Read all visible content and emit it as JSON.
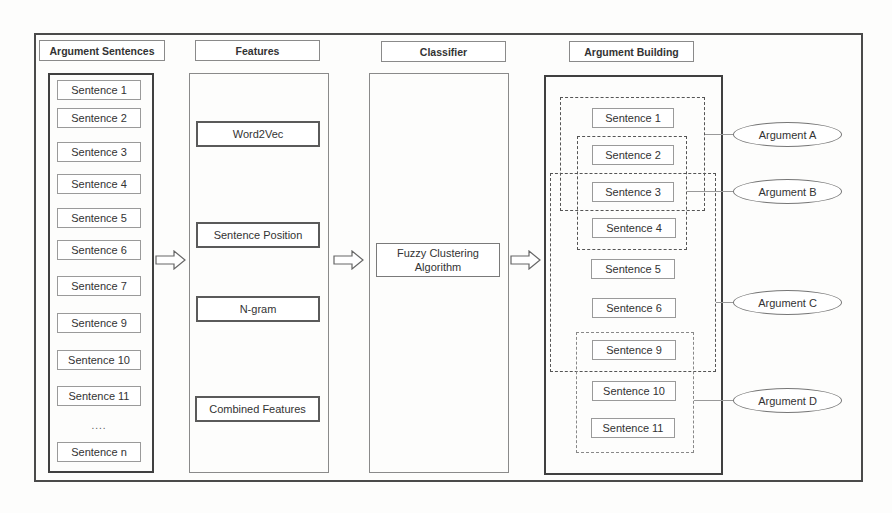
{
  "headers": {
    "argument_sentences": "Argument Sentences",
    "features": "Features",
    "classifier": "Classifier",
    "argument_building": "Argument Building"
  },
  "input_sentences": [
    "Sentence 1",
    "Sentence 2",
    "Sentence 3",
    "Sentence 4",
    "Sentence 5",
    "Sentence 6",
    "Sentence 7",
    "Sentence 9",
    "Sentence 10",
    "Sentence 11",
    "Sentence n"
  ],
  "ellipsis": "....",
  "features": [
    "Word2Vec",
    "Sentence Position",
    "N-gram",
    "Combined Features"
  ],
  "classifier": {
    "line1": "Fuzzy Clustering",
    "line2": "Algorithm"
  },
  "output_sentences": [
    "Sentence 1",
    "Sentence 2",
    "Sentence 3",
    "Sentence 4",
    "Sentence 5",
    "Sentence 6",
    "Sentence 9",
    "Sentence 10",
    "Sentence 11"
  ],
  "arguments": [
    "Argument A",
    "Argument B",
    "Argument C",
    "Argument D"
  ],
  "colors": {
    "frame": "#4a4a4a",
    "box_border": "#8a8a8a",
    "background": "#fdfdfc"
  }
}
